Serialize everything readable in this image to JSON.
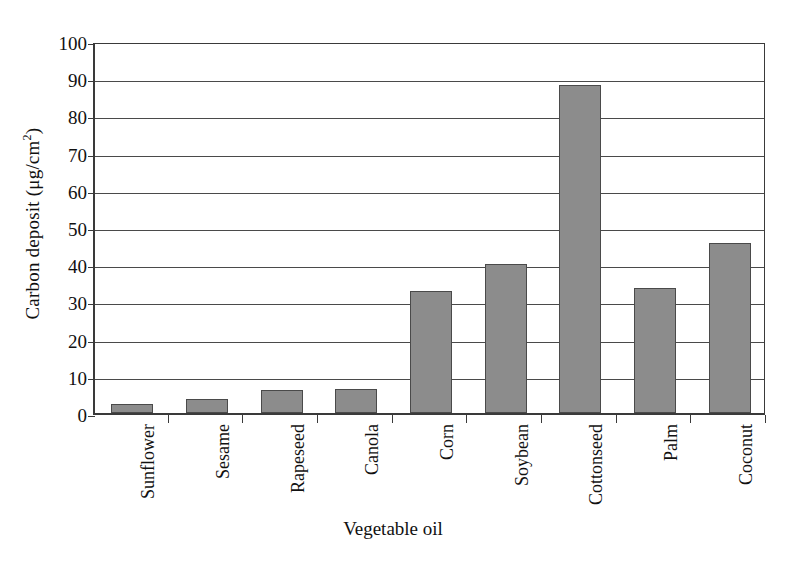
{
  "chart_data": {
    "type": "bar",
    "title": "",
    "xlabel": "Vegetable oil",
    "ylabel": "Carbon deposit (μg/cm2)",
    "ylabel_text": "Carbon deposit (μg/cm",
    "ylabel_sup": "2",
    "ylabel_close": ")",
    "categories": [
      "Sunflower",
      "Sesame",
      "Rapeseed",
      "Canola",
      "Corn",
      "Soybean",
      "Cottonseed",
      "Palm",
      "Coconut"
    ],
    "values": [
      2.3,
      3.7,
      6.1,
      6.4,
      32.8,
      40.0,
      88.2,
      33.6,
      45.7
    ],
    "ylim": [
      0,
      100
    ],
    "yticks": [
      100,
      90,
      80,
      70,
      60,
      50,
      40,
      30,
      20,
      10,
      0
    ],
    "ytick_labels": [
      "100",
      "90",
      "80",
      "70",
      "60",
      "50",
      "40",
      "30",
      "20",
      "10",
      "0"
    ],
    "grid": true,
    "grid_axis": "y",
    "legend": "none",
    "bar_color": "#8c8c8c",
    "bar_edge_color": "#4a4a4a",
    "axis_color": "#3a3a3a",
    "background": "#ffffff"
  }
}
